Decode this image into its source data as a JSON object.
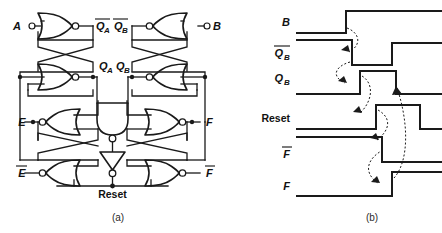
{
  "figure": {
    "panels": [
      {
        "id": "a",
        "caption": "(a)",
        "kind": "logic-circuit-schematic"
      },
      {
        "id": "b",
        "caption": "(b)",
        "kind": "timing-diagram"
      }
    ]
  },
  "circuit": {
    "inputs": [
      {
        "name": "A",
        "label": "A",
        "overbar": false,
        "terminal": "open-circle",
        "side": "left"
      },
      {
        "name": "B",
        "label": "B",
        "overbar": false,
        "terminal": "open-circle",
        "side": "right"
      },
      {
        "name": "E",
        "label": "E",
        "overbar": false,
        "terminal": "junction-dot",
        "side": "left"
      },
      {
        "name": "E-bar",
        "label": "E",
        "overbar": true,
        "terminal": "none",
        "side": "left"
      },
      {
        "name": "F",
        "label": "F",
        "overbar": false,
        "terminal": "junction-dot",
        "side": "right"
      },
      {
        "name": "F-bar",
        "label": "F",
        "overbar": true,
        "terminal": "none",
        "side": "right"
      }
    ],
    "nodes": [
      {
        "name": "QA-bar",
        "label": "Q",
        "sub": "A",
        "overbar": true
      },
      {
        "name": "QA",
        "label": "Q",
        "sub": "A",
        "overbar": false
      },
      {
        "name": "QB-bar",
        "label": "Q",
        "sub": "B",
        "overbar": true
      },
      {
        "name": "QB",
        "label": "Q",
        "sub": "B",
        "overbar": false
      },
      {
        "name": "Reset",
        "label": "Reset",
        "overbar": false
      }
    ],
    "gates": [
      {
        "name": "nor-qa-bar",
        "type": "NOR",
        "orientation": "right"
      },
      {
        "name": "nor-qa",
        "type": "NOR",
        "orientation": "right"
      },
      {
        "name": "nor-qb-bar",
        "type": "NOR",
        "orientation": "left"
      },
      {
        "name": "nor-qb",
        "type": "NOR",
        "orientation": "left"
      },
      {
        "name": "nor-e",
        "type": "NOR",
        "orientation": "left"
      },
      {
        "name": "nor-e-bar",
        "type": "NOR",
        "orientation": "left"
      },
      {
        "name": "nor-f",
        "type": "NOR",
        "orientation": "right"
      },
      {
        "name": "nor-f-bar",
        "type": "NOR",
        "orientation": "right"
      },
      {
        "name": "nand-center",
        "type": "NAND",
        "orientation": "down"
      },
      {
        "name": "inverter-center",
        "type": "NOT",
        "orientation": "down"
      }
    ],
    "caption": "(a)"
  },
  "timing": {
    "caption": "(b)",
    "signals": [
      {
        "name": "B",
        "label": "B",
        "sub": "",
        "overbar": false
      },
      {
        "name": "QB-bar",
        "label": "Q",
        "sub": "B",
        "overbar": true
      },
      {
        "name": "QB",
        "label": "Q",
        "sub": "B",
        "overbar": false
      },
      {
        "name": "Reset",
        "label": "Reset",
        "sub": "",
        "overbar": false
      },
      {
        "name": "F-bar",
        "label": "F",
        "sub": "",
        "overbar": true
      },
      {
        "name": "F",
        "label": "F",
        "sub": "",
        "overbar": false
      }
    ],
    "waveform_data": {
      "type": "digital-timing",
      "x_range": [
        296,
        442
      ],
      "traces": [
        {
          "signal": "B",
          "initial": 0,
          "transitions": [
            {
              "x": 346,
              "edge": "rise"
            }
          ]
        },
        {
          "signal": "QB-bar",
          "initial": 1,
          "transitions": [
            {
              "x": 352,
              "edge": "fall"
            },
            {
              "x": 392,
              "edge": "rise"
            }
          ]
        },
        {
          "signal": "QB",
          "initial": 0,
          "transitions": [
            {
              "x": 360,
              "edge": "rise"
            },
            {
              "x": 396,
              "edge": "fall"
            }
          ]
        },
        {
          "signal": "Reset",
          "initial": 0,
          "transitions": [
            {
              "x": 376,
              "edge": "rise"
            },
            {
              "x": 420,
              "edge": "fall"
            }
          ]
        },
        {
          "signal": "F-bar",
          "initial": 1,
          "transitions": [
            {
              "x": 382,
              "edge": "fall"
            }
          ]
        },
        {
          "signal": "F",
          "initial": 0,
          "transitions": [
            {
              "x": 392,
              "edge": "rise"
            }
          ]
        }
      ],
      "causality_arrows": [
        {
          "from": "B",
          "to": "QB-bar"
        },
        {
          "from": "QB-bar",
          "to": "QB"
        },
        {
          "from": "QB",
          "to": "Reset"
        },
        {
          "from": "Reset",
          "to": "F-bar"
        },
        {
          "from": "F-bar",
          "to": "F"
        },
        {
          "from": "F",
          "to": "QB"
        }
      ]
    }
  }
}
